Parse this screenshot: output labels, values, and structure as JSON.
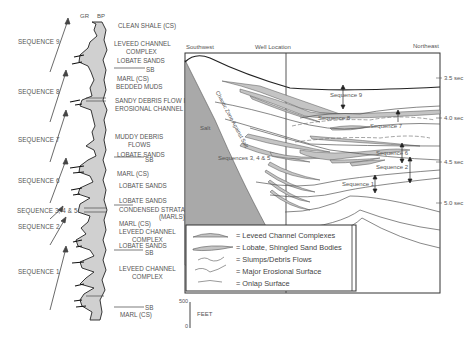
{
  "well_log": {
    "curve_labels": [
      "GR",
      "BP"
    ],
    "sequences": [
      {
        "label": "SEQUENCE 9",
        "y": 40
      },
      {
        "label": "SEQUENCE 8",
        "y": 90
      },
      {
        "label": "SEQUENCE 7",
        "y": 138
      },
      {
        "label": "SEQUENCE 6",
        "y": 178
      },
      {
        "label": "SEQUENCE 3, 4 & 5",
        "y": 209
      },
      {
        "label": "SEQUENCE 2",
        "y": 226
      },
      {
        "label": "SEQUENCE 1",
        "y": 271
      }
    ],
    "facies": [
      {
        "text": "CLEAN SHALE (CS)",
        "x": 142,
        "y": 25
      },
      {
        "text": "LEVEED CHANNEL",
        "x": 142,
        "y": 42
      },
      {
        "text": "COMPLEX",
        "x": 155,
        "y": 50
      },
      {
        "text": "LOBATE SANDS",
        "x": 146,
        "y": 58
      },
      {
        "text": "SB",
        "x": 166,
        "y": 68
      },
      {
        "text": "MARL (CS)",
        "x": 145,
        "y": 76
      },
      {
        "text": "BEDDED MUDS",
        "x": 143,
        "y": 84
      },
      {
        "text": "SANDY DEBRIS FLOW IN",
        "x": 141,
        "y": 97
      },
      {
        "text": "EROSIONAL CHANNEL",
        "x": 141,
        "y": 105
      },
      {
        "text": "MUDDY DEBRIS",
        "x": 144,
        "y": 133
      },
      {
        "text": "FLOWS",
        "x": 156,
        "y": 141
      },
      {
        "text": "LOBATE SANDS",
        "x": 145,
        "y": 150
      },
      {
        "text": "SB",
        "x": 166,
        "y": 157
      },
      {
        "text": "MARL (CS)",
        "x": 147,
        "y": 169
      },
      {
        "text": "LOBATE SANDS",
        "x": 148,
        "y": 181
      },
      {
        "text": "LOBATE SANDS",
        "x": 148,
        "y": 195
      },
      {
        "text": "CONDENSED STRATA",
        "x": 122,
        "y": 205
      },
      {
        "text": "(MARLS)",
        "x": 160,
        "y": 212
      },
      {
        "text": "MARL (CS)",
        "x": 120,
        "y": 219
      },
      {
        "text": "LEVEED CHANNEL",
        "x": 120,
        "y": 227
      },
      {
        "text": "COMPLEX",
        "x": 133,
        "y": 235
      },
      {
        "text": "LOBATE SANDS",
        "x": 121,
        "y": 243
      },
      {
        "text": "SB",
        "x": 147,
        "y": 250
      },
      {
        "text": "LEVEED CHANNEL",
        "x": 120,
        "y": 265
      },
      {
        "text": "COMPLEX",
        "x": 133,
        "y": 273
      },
      {
        "text": "SB",
        "x": 147,
        "y": 307
      },
      {
        "text": "MARL (CS)",
        "x": 120,
        "y": 314
      }
    ],
    "scale": {
      "top": "500",
      "bottom": "0",
      "unit": "FEET"
    }
  },
  "cross_section": {
    "headers": {
      "left": "Southwest",
      "middle": "Well Location",
      "right": "Northeast"
    },
    "time_ticks": [
      "3.5 sec",
      "4.0 sec",
      "4.5 sec",
      "5.0 sec"
    ],
    "labels": {
      "salt": "Salt",
      "zone": "Chaotic Zone Against Salt",
      "seq9": "Sequence 9",
      "seq8": "Sequence 8",
      "seq7": "Sequence 7",
      "seq345": "Sequences 3, 4 & 5",
      "seq6": "Sequence 6",
      "seq2": "Sequence 2",
      "seq1": "Sequence 1"
    },
    "colors": {
      "salt": "#a9a9a9",
      "sand": "#c4c4c4",
      "line": "#555555"
    }
  },
  "legend": {
    "items": [
      {
        "symbol": "leveed-channel",
        "text": "= Leveed Channel Complexes"
      },
      {
        "symbol": "lobate-sand",
        "text": "= Lobate, Shingled Sand Bodies"
      },
      {
        "symbol": "slump",
        "text": "= Slumps/Debris Flows"
      },
      {
        "symbol": "erosional",
        "text": "= Major Erosional Surface"
      },
      {
        "symbol": "onlap",
        "text": "= Onlap Surface"
      }
    ]
  }
}
